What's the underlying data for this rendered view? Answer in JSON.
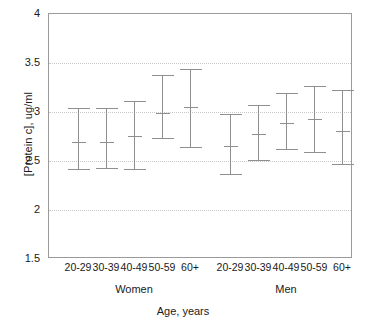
{
  "chart_data": {
    "type": "scatter",
    "title": "",
    "xlabel": "Age, years",
    "ylabel": "[Protein c], ug/ml",
    "ylim": [
      1.5,
      4
    ],
    "yticks": [
      1.5,
      2,
      2.5,
      3,
      3.5,
      4
    ],
    "ytick_labels": [
      "1.5",
      "2",
      "2.5",
      "3",
      "3.5",
      "4"
    ],
    "gridlines": [
      2,
      2.5,
      3,
      3.5
    ],
    "grid": "horizontal-dotted",
    "legend": "none",
    "categories": [
      "20-29",
      "30-39",
      "40-49",
      "50-59",
      "60+"
    ],
    "groups": [
      "Women",
      "Men"
    ],
    "series": [
      {
        "name": "Women",
        "points": [
          {
            "category": "20-29",
            "mean": 2.69,
            "lower": 2.42,
            "upper": 3.04
          },
          {
            "category": "30-39",
            "mean": 2.69,
            "lower": 2.43,
            "upper": 3.04
          },
          {
            "category": "40-49",
            "mean": 2.76,
            "lower": 2.42,
            "upper": 3.11
          },
          {
            "category": "50-59",
            "mean": 2.99,
            "lower": 2.73,
            "upper": 3.38
          },
          {
            "category": "60+",
            "mean": 3.05,
            "lower": 2.64,
            "upper": 3.44
          }
        ]
      },
      {
        "name": "Men",
        "points": [
          {
            "category": "20-29",
            "mean": 2.65,
            "lower": 2.37,
            "upper": 2.98
          },
          {
            "category": "30-39",
            "mean": 2.78,
            "lower": 2.51,
            "upper": 3.07
          },
          {
            "category": "40-49",
            "mean": 2.89,
            "lower": 2.62,
            "upper": 3.19
          },
          {
            "category": "50-59",
            "mean": 2.93,
            "lower": 2.59,
            "upper": 3.27
          },
          {
            "category": "60+",
            "mean": 2.81,
            "lower": 2.47,
            "upper": 3.22
          }
        ]
      }
    ],
    "xtick_labels": [
      "20-29",
      "30-39",
      "40-49",
      "50-59",
      "60+",
      "20-29",
      "30-39",
      "40-49",
      "50-59",
      "60+"
    ],
    "colors": {
      "marker": "#8f8f8f",
      "axis": "#9a9a9a",
      "grid": "#c9c9c9",
      "text": "#1a1a1a",
      "background": "#ffffff"
    }
  }
}
